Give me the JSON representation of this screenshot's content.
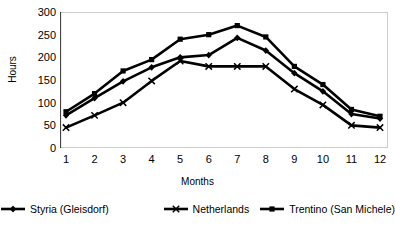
{
  "chart_data": {
    "type": "line",
    "title": "",
    "xlabel": "Months",
    "ylabel": "Hours",
    "categories": [
      "1",
      "2",
      "3",
      "4",
      "5",
      "6",
      "7",
      "8",
      "9",
      "10",
      "11",
      "12"
    ],
    "x": [
      1,
      2,
      3,
      4,
      5,
      6,
      7,
      8,
      9,
      10,
      11,
      12
    ],
    "xlim": [
      1,
      12
    ],
    "ylim": [
      0,
      300
    ],
    "yticks": [
      0,
      50,
      100,
      150,
      200,
      250,
      300
    ],
    "grid": false,
    "legend_position": "bottom",
    "series": [
      {
        "name": "Styria (Gleisdorf)",
        "marker": "diamond",
        "color": "#000000",
        "values": [
          72,
          110,
          147,
          178,
          200,
          205,
          243,
          215,
          165,
          125,
          75,
          65
        ]
      },
      {
        "name": "Netherlands",
        "marker": "x",
        "color": "#000000",
        "values": [
          45,
          72,
          100,
          148,
          192,
          180,
          180,
          180,
          130,
          95,
          50,
          45
        ]
      },
      {
        "name": "Trentino (San Michele)",
        "marker": "square",
        "color": "#000000",
        "values": [
          80,
          120,
          170,
          195,
          240,
          250,
          270,
          245,
          180,
          140,
          85,
          70
        ]
      }
    ]
  },
  "legend": {
    "items": [
      {
        "label": "Styria (Gleisdorf)"
      },
      {
        "label": "Netherlands"
      },
      {
        "label": "Trentino (San Michele)"
      }
    ]
  },
  "axes": {
    "ylabel": "Hours",
    "xlabel": "Months"
  }
}
